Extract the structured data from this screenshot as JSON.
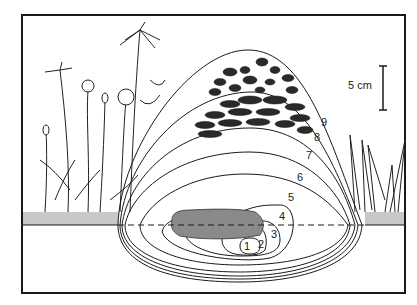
{
  "figure": {
    "type": "cross-section diagram",
    "scale_bar": {
      "label": "5 cm"
    },
    "contour_labels": [
      "1",
      "2",
      "3",
      "4",
      "5",
      "6",
      "7",
      "8",
      "9"
    ],
    "elements": [
      "dung pat at soil surface",
      "nested contour zones 1-9",
      "dark pellet/aggregate layers above zones 8-9",
      "plants on left and right",
      "dashed ground line"
    ],
    "colors": {
      "ink": "#1a1a1a",
      "background": "#ffffff",
      "pellets": "#2a2a2a",
      "soil": "#8a8a8a"
    }
  }
}
